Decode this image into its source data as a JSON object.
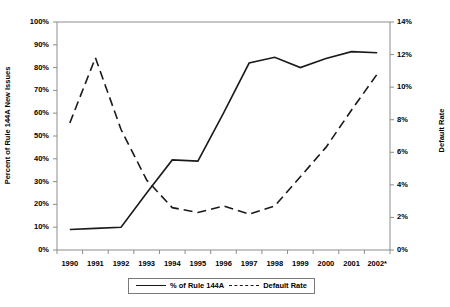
{
  "chart_data": {
    "type": "line",
    "title": "",
    "xlabel": "",
    "ylabel": "Percent of Rule 144A New Issues",
    "ylabel_secondary": "Default Rate",
    "grid": false,
    "legend_position": "bottom",
    "categories": [
      "1990",
      "1991",
      "1992",
      "1993",
      "1994",
      "1995",
      "1996",
      "1997",
      "1998",
      "1999",
      "2000",
      "2001",
      "2002*"
    ],
    "ylim": [
      0,
      100
    ],
    "ylim_secondary": [
      0,
      14
    ],
    "yticks": [
      "0%",
      "10%",
      "20%",
      "30%",
      "40%",
      "50%",
      "60%",
      "70%",
      "80%",
      "90%",
      "100%"
    ],
    "yticks_secondary": [
      "0%",
      "2%",
      "4%",
      "6%",
      "8%",
      "10%",
      "12%",
      "14%"
    ],
    "series": [
      {
        "name": "% of Rule 144A",
        "axis": "left",
        "style": "solid",
        "color": "#1a1a1a",
        "values": [
          9,
          9.5,
          10,
          25,
          39.5,
          39,
          60,
          82,
          84.5,
          80,
          84,
          87,
          86.5
        ]
      },
      {
        "name": "Default Rate",
        "axis": "right",
        "style": "dashed",
        "color": "#1a1a1a",
        "values": [
          7.8,
          11.8,
          7.4,
          4.3,
          2.6,
          2.3,
          2.7,
          2.2,
          2.7,
          4.5,
          6.3,
          8.6,
          10.8
        ]
      }
    ]
  },
  "legend": {
    "items": [
      {
        "label": "% of Rule 144A",
        "style": "solid"
      },
      {
        "label": "Default Rate",
        "style": "dashed"
      }
    ]
  }
}
